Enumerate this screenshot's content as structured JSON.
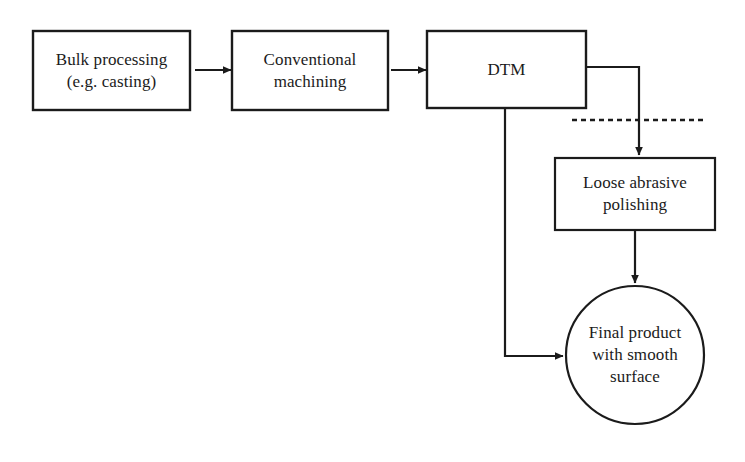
{
  "diagram": {
    "background_color": "#ffffff",
    "stroke_color": "#1b1b1b",
    "text_color": "#1b1b1b",
    "nodes": [
      {
        "id": "bulk-processing",
        "shape": "rectangle",
        "label": "Bulk processing\n(e.g. casting)",
        "line1": "Bulk processing",
        "line2": "(e.g. casting)"
      },
      {
        "id": "conventional-machining",
        "shape": "rectangle",
        "label": "Conventional\nmachining",
        "line1": "Conventional",
        "line2": "machining"
      },
      {
        "id": "dtm",
        "shape": "rectangle",
        "label": "DTM",
        "line1": "DTM",
        "line2": ""
      },
      {
        "id": "loose-abrasive-polishing",
        "shape": "rectangle",
        "label": "Loose abrasive\npolishing",
        "line1": "Loose abrasive",
        "line2": "polishing"
      },
      {
        "id": "final-product",
        "shape": "circle",
        "label": "Final product\nwith smooth\nsurface",
        "line1": "Final product",
        "line2": "with smooth",
        "line3": "surface"
      }
    ],
    "connectors": [
      {
        "id": "bulk-to-machining",
        "from": "bulk-processing",
        "to": "conventional-machining",
        "style": "solid",
        "arrow": true
      },
      {
        "id": "machining-to-dtm",
        "from": "conventional-machining",
        "to": "dtm",
        "style": "solid",
        "arrow": true
      },
      {
        "id": "dtm-to-polishing",
        "from": "dtm",
        "to": "loose-abrasive-polishing",
        "style": "solid",
        "arrow": true
      },
      {
        "id": "dtm-to-final-product",
        "from": "dtm",
        "to": "final-product",
        "style": "solid",
        "arrow": true
      },
      {
        "id": "polishing-to-final-product",
        "from": "loose-abrasive-polishing",
        "to": "final-product",
        "style": "solid",
        "arrow": true
      },
      {
        "id": "separator-dashed-line",
        "from": "",
        "to": "",
        "style": "dashed",
        "arrow": false
      }
    ]
  }
}
